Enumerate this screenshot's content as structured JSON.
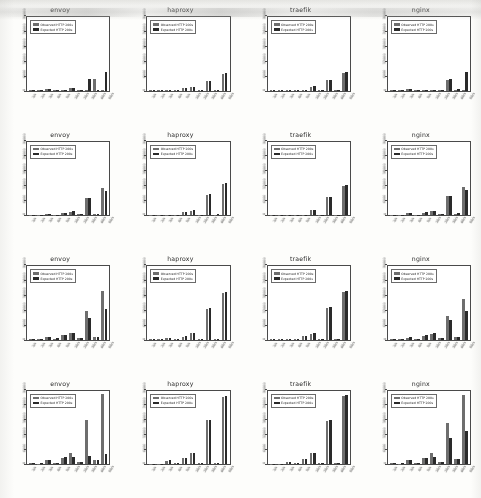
{
  "figure": {
    "kind": "bar-chart-grid",
    "rows": 4,
    "columns": 4,
    "background_color": "#fdfdfb",
    "observed_color": "#6e6e6e",
    "expected_color": "#2a2a2a"
  },
  "legend": {
    "observed_label": "Observed HTTP 200s",
    "expected_label": "Expected HTTP 200s",
    "position": "upper left"
  },
  "axis": {
    "ytick_labels": [
      "0",
      "6000",
      "12000",
      "18000",
      "24000",
      "30000"
    ],
    "xtick_labels": [
      "1/s",
      "2/s",
      "3/s",
      "4/s",
      "5/s",
      "10/s",
      "20/s",
      "30/s",
      "40/s",
      "50/s"
    ],
    "ylim": [
      0,
      30000
    ],
    "xlabel": "",
    "ylabel": "",
    "grid": false
  },
  "chart_data": [
    {
      "type": "bar",
      "title": "envoy",
      "row": 1,
      "column": 1,
      "categories": [
        "1/s",
        "2/s",
        "3/s",
        "4/s",
        "5/s",
        "10/s",
        "20/s",
        "30/s",
        "40/s",
        "50/s"
      ],
      "series": [
        {
          "name": "Observed HTTP 200s",
          "values": [
            160,
            120,
            480,
            130,
            110,
            900,
            280,
            150,
            4600,
            140
          ]
        },
        {
          "name": "Expected HTTP 200s",
          "values": [
            180,
            300,
            520,
            160,
            150,
            1150,
            320,
            4700,
            210,
            7400
          ]
        }
      ],
      "ylim": [
        0,
        30000
      ],
      "xlabel": "",
      "ylabel": ""
    },
    {
      "type": "bar",
      "title": "haproxy",
      "row": 1,
      "column": 2,
      "categories": [
        "1/s",
        "2/s",
        "3/s",
        "4/s",
        "5/s",
        "10/s",
        "20/s",
        "30/s",
        "40/s",
        "50/s"
      ],
      "series": [
        {
          "name": "Observed HTTP 200s",
          "values": [
            100,
            110,
            130,
            150,
            900,
            1250,
            160,
            3900,
            150,
            6900
          ]
        },
        {
          "name": "Expected HTTP 200s",
          "values": [
            110,
            120,
            140,
            170,
            950,
            1300,
            170,
            4000,
            160,
            7100
          ]
        }
      ],
      "ylim": [
        0,
        30000
      ],
      "xlabel": "",
      "ylabel": ""
    },
    {
      "type": "bar",
      "title": "traefik",
      "row": 1,
      "column": 3,
      "categories": [
        "1/s",
        "2/s",
        "3/s",
        "4/s",
        "5/s",
        "10/s",
        "20/s",
        "30/s",
        "40/s",
        "50/s"
      ],
      "series": [
        {
          "name": "Observed HTTP 200s",
          "values": [
            90,
            100,
            110,
            120,
            130,
            1600,
            140,
            4300,
            130,
            7300
          ]
        },
        {
          "name": "Expected HTTP 200s",
          "values": [
            95,
            105,
            115,
            125,
            135,
            1650,
            145,
            4400,
            140,
            7500
          ]
        }
      ],
      "ylim": [
        0,
        30000
      ],
      "xlabel": "",
      "ylabel": ""
    },
    {
      "type": "bar",
      "title": "nginx",
      "row": 1,
      "column": 4,
      "categories": [
        "1/s",
        "2/s",
        "3/s",
        "4/s",
        "5/s",
        "10/s",
        "20/s",
        "30/s",
        "40/s",
        "50/s"
      ],
      "series": [
        {
          "name": "Observed HTTP 200s",
          "values": [
            110,
            120,
            600,
            140,
            130,
            330,
            160,
            4300,
            380,
            140
          ]
        },
        {
          "name": "Expected HTTP 200s",
          "values": [
            120,
            130,
            650,
            150,
            140,
            360,
            170,
            4500,
            420,
            7400
          ]
        }
      ],
      "ylim": [
        0,
        30000
      ],
      "xlabel": "",
      "ylabel": ""
    },
    {
      "type": "bar",
      "title": "envoy",
      "row": 2,
      "column": 1,
      "categories": [
        "1/s",
        "2/s",
        "3/s",
        "4/s",
        "5/s",
        "10/s",
        "20/s",
        "30/s",
        "40/s",
        "50/s"
      ],
      "series": [
        {
          "name": "Observed HTTP 200s",
          "values": [
            150,
            160,
            400,
            180,
            900,
            1350,
            320,
            6900,
            500,
            11200
          ]
        },
        {
          "name": "Expected HTTP 200s",
          "values": [
            160,
            180,
            430,
            200,
            1000,
            1500,
            340,
            7100,
            530,
            9800
          ]
        }
      ],
      "ylim": [
        0,
        30000
      ],
      "xlabel": "",
      "ylabel": ""
    },
    {
      "type": "bar",
      "title": "haproxy",
      "row": 2,
      "column": 2,
      "categories": [
        "1/s",
        "2/s",
        "3/s",
        "4/s",
        "5/s",
        "10/s",
        "20/s",
        "30/s",
        "40/s",
        "50/s"
      ],
      "series": [
        {
          "name": "Observed HTTP 200s",
          "values": [
            120,
            130,
            160,
            190,
            1100,
            1800,
            200,
            8300,
            210,
            12600
          ]
        },
        {
          "name": "Expected HTTP 200s",
          "values": [
            125,
            135,
            165,
            195,
            1150,
            1850,
            210,
            8500,
            220,
            12900
          ]
        }
      ],
      "ylim": [
        0,
        30000
      ],
      "xlabel": "",
      "ylabel": ""
    },
    {
      "type": "bar",
      "title": "traefik",
      "row": 2,
      "column": 3,
      "categories": [
        "1/s",
        "2/s",
        "3/s",
        "4/s",
        "5/s",
        "10/s",
        "20/s",
        "30/s",
        "40/s",
        "50/s"
      ],
      "series": [
        {
          "name": "Observed HTTP 200s",
          "values": [
            100,
            110,
            130,
            150,
            170,
            2100,
            180,
            7200,
            160,
            11900
          ]
        },
        {
          "name": "Expected HTTP 200s",
          "values": [
            105,
            115,
            135,
            155,
            175,
            2200,
            190,
            7400,
            170,
            12200
          ]
        }
      ],
      "ylim": [
        0,
        30000
      ],
      "xlabel": "",
      "ylabel": ""
    },
    {
      "type": "bar",
      "title": "nginx",
      "row": 2,
      "column": 4,
      "categories": [
        "1/s",
        "2/s",
        "3/s",
        "4/s",
        "5/s",
        "10/s",
        "20/s",
        "30/s",
        "40/s",
        "50/s"
      ],
      "series": [
        {
          "name": "Observed HTTP 200s",
          "values": [
            130,
            140,
            700,
            160,
            1000,
            1500,
            340,
            7600,
            600,
            11500
          ]
        },
        {
          "name": "Expected HTTP 200s",
          "values": [
            140,
            150,
            750,
            170,
            1100,
            1600,
            360,
            7900,
            640,
            10100
          ]
        }
      ],
      "ylim": [
        0,
        30000
      ],
      "xlabel": "",
      "ylabel": ""
    },
    {
      "type": "bar",
      "title": "envoy",
      "row": 3,
      "column": 1,
      "categories": [
        "1/s",
        "2/s",
        "3/s",
        "4/s",
        "5/s",
        "10/s",
        "20/s",
        "30/s",
        "40/s",
        "50/s"
      ],
      "series": [
        {
          "name": "Observed HTTP 200s",
          "values": [
            170,
            200,
            900,
            400,
            1900,
            2600,
            500,
            11600,
            1100,
            19800
          ]
        },
        {
          "name": "Expected HTTP 200s",
          "values": [
            180,
            220,
            950,
            430,
            2000,
            2800,
            530,
            8900,
            1200,
            12300
          ]
        }
      ],
      "ylim": [
        0,
        30000
      ],
      "xlabel": "",
      "ylabel": ""
    },
    {
      "type": "bar",
      "title": "haproxy",
      "row": 3,
      "column": 2,
      "categories": [
        "1/s",
        "2/s",
        "3/s",
        "4/s",
        "5/s",
        "10/s",
        "20/s",
        "30/s",
        "40/s",
        "50/s"
      ],
      "series": [
        {
          "name": "Observed HTTP 200s",
          "values": [
            120,
            140,
            600,
            200,
            1200,
            2600,
            230,
            12600,
            240,
            18900
          ]
        },
        {
          "name": "Expected HTTP 200s",
          "values": [
            125,
            145,
            620,
            210,
            1250,
            2700,
            240,
            12800,
            250,
            19200
          ]
        }
      ],
      "ylim": [
        0,
        30000
      ],
      "xlabel": "",
      "ylabel": ""
    },
    {
      "type": "bar",
      "title": "traefik",
      "row": 3,
      "column": 3,
      "categories": [
        "1/s",
        "2/s",
        "3/s",
        "4/s",
        "5/s",
        "10/s",
        "20/s",
        "30/s",
        "40/s",
        "50/s"
      ],
      "series": [
        {
          "name": "Observed HTTP 200s",
          "values": [
            110,
            130,
            150,
            170,
            1300,
            2400,
            200,
            12900,
            210,
            19300
          ]
        },
        {
          "name": "Expected HTTP 200s",
          "values": [
            115,
            135,
            155,
            175,
            1350,
            2500,
            210,
            13100,
            220,
            19600
          ]
        }
      ],
      "ylim": [
        0,
        30000
      ],
      "xlabel": "",
      "ylabel": ""
    },
    {
      "type": "bar",
      "title": "nginx",
      "row": 3,
      "column": 4,
      "categories": [
        "1/s",
        "2/s",
        "3/s",
        "4/s",
        "5/s",
        "10/s",
        "20/s",
        "30/s",
        "40/s",
        "50/s"
      ],
      "series": [
        {
          "name": "Observed HTTP 200s",
          "values": [
            150,
            180,
            800,
            300,
            1600,
            2300,
            450,
            9600,
            900,
            16400
          ]
        },
        {
          "name": "Expected HTTP 200s",
          "values": [
            160,
            190,
            850,
            320,
            1700,
            2500,
            480,
            8100,
            960,
            11800
          ]
        }
      ],
      "ylim": [
        0,
        30000
      ],
      "xlabel": "",
      "ylabel": ""
    },
    {
      "type": "bar",
      "title": "envoy",
      "row": 4,
      "column": 1,
      "categories": [
        "1/s",
        "2/s",
        "3/s",
        "4/s",
        "5/s",
        "10/s",
        "20/s",
        "30/s",
        "40/s",
        "50/s"
      ],
      "series": [
        {
          "name": "Observed HTTP 200s",
          "values": [
            300,
            200,
            1600,
            400,
            2600,
            4700,
            900,
            17800,
            1700,
            28600
          ]
        },
        {
          "name": "Expected HTTP 200s",
          "values": [
            320,
            220,
            1700,
            430,
            2800,
            2900,
            950,
            3400,
            1800,
            4100
          ]
        }
      ],
      "ylim": [
        0,
        30000
      ],
      "xlabel": "",
      "ylabel": ""
    },
    {
      "type": "bar",
      "title": "haproxy",
      "row": 4,
      "column": 2,
      "categories": [
        "1/s",
        "2/s",
        "3/s",
        "4/s",
        "5/s",
        "10/s",
        "20/s",
        "30/s",
        "40/s",
        "50/s"
      ],
      "series": [
        {
          "name": "Observed HTTP 200s",
          "values": [
            180,
            200,
            1400,
            300,
            2400,
            4600,
            260,
            17900,
            280,
            27400
          ]
        },
        {
          "name": "Expected HTTP 200s",
          "values": [
            185,
            205,
            1450,
            310,
            2450,
            4700,
            270,
            18100,
            290,
            27700
          ]
        }
      ],
      "ylim": [
        0,
        30000
      ],
      "xlabel": "",
      "ylabel": ""
    },
    {
      "type": "bar",
      "title": "traefik",
      "row": 4,
      "column": 3,
      "categories": [
        "1/s",
        "2/s",
        "3/s",
        "4/s",
        "5/s",
        "10/s",
        "20/s",
        "30/s",
        "40/s",
        "50/s"
      ],
      "series": [
        {
          "name": "Observed HTTP 200s",
          "values": [
            160,
            180,
            900,
            260,
            2200,
            4300,
            240,
            17600,
            250,
            27900
          ]
        },
        {
          "name": "Expected HTTP 200s",
          "values": [
            165,
            185,
            930,
            270,
            2250,
            4400,
            250,
            17900,
            260,
            28200
          ]
        }
      ],
      "ylim": [
        0,
        30000
      ],
      "xlabel": "",
      "ylabel": ""
    },
    {
      "type": "bar",
      "title": "nginx",
      "row": 4,
      "column": 4,
      "categories": [
        "1/s",
        "2/s",
        "3/s",
        "4/s",
        "5/s",
        "10/s",
        "20/s",
        "30/s",
        "40/s",
        "50/s"
      ],
      "series": [
        {
          "name": "Observed HTTP 200s",
          "values": [
            280,
            200,
            1700,
            400,
            2400,
            4400,
            900,
            16900,
            1900,
            28100
          ]
        },
        {
          "name": "Expected HTTP 200s",
          "values": [
            300,
            220,
            1750,
            430,
            2500,
            2700,
            950,
            10600,
            2000,
            13500
          ]
        }
      ],
      "ylim": [
        0,
        30000
      ],
      "xlabel": "",
      "ylabel": ""
    }
  ]
}
